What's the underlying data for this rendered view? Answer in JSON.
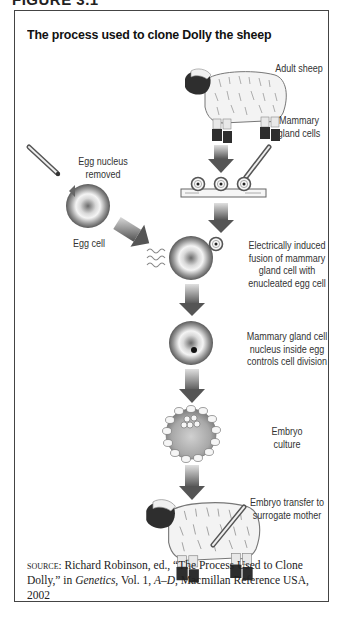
{
  "figure_heading": "FIGURE 3.1",
  "title": "The process used to clone Dolly the sheep",
  "labels": {
    "adult_sheep": "Adult sheep",
    "mammary_gland_cells": [
      "Mammary",
      "gland cells"
    ],
    "egg_nucleus_removed": [
      "Egg nucleus",
      "removed"
    ],
    "egg_cell": "Egg cell",
    "fusion": [
      "Electrically induced",
      "fusion of mammary",
      "gland cell with",
      "enucleated egg cell"
    ],
    "nucleus_controls": [
      "Mammary gland cell",
      "nucleus inside egg",
      "controls cell division"
    ],
    "embryo_culture": [
      "Embryo",
      "culture"
    ],
    "embryo_transfer": [
      "Embryo transfer to",
      "surrogate mother"
    ]
  },
  "source": {
    "prefix": "source:",
    "text_1": " Richard Robinson, ed., “The Process Used to Clone Dolly,” in ",
    "italic_1": "Genetics",
    "text_2": ", Vol. 1, ",
    "italic_2": "A–D",
    "text_3": ", Macmillan Reference USA, 2002"
  },
  "colors": {
    "frame": "#444444",
    "arrow_dark": "#555555",
    "arrow_light": "#c8c8c8",
    "cell_dark": "#6a6a6a",
    "cell_light": "#f2f2f2"
  }
}
